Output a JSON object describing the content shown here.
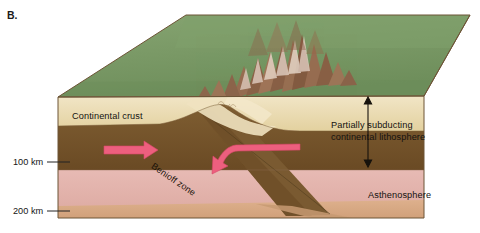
{
  "figure": {
    "panel_label": "B.",
    "type": "geologic block diagram"
  },
  "labels": {
    "continental_crust": "Continental crust",
    "benioff_zone": "Benioff zone",
    "partially_subducting": "Partially subducting\ncontinental lithosphere",
    "partially_subducting_line1": "Partially subducting",
    "partially_subducting_line2": "continental lithosphere",
    "asthenosphere": "Asthenosphere"
  },
  "depth_scale": {
    "ticks": [
      {
        "label": "100 km",
        "y": 162
      },
      {
        "label": "200 km",
        "y": 211
      }
    ]
  },
  "colors": {
    "surface_green": "#7d9c6a",
    "surface_green_dark": "#6f8f5d",
    "crust_cream": "#e8d8ac",
    "crust_cream_light": "#f0e4c4",
    "mantle_brown": "#7b5a30",
    "mantle_brown_dark": "#6b4c26",
    "asthenosphere_pink": "#e3b3ae",
    "asthenosphere_pink_dark": "#dba79f",
    "lower_tan": "#d8a882",
    "arrow_pink": "#ed5f7e",
    "mountain_brown": "#8a5a45",
    "outline": "#6d5436",
    "text": "#141210"
  },
  "elements": {
    "arrow_left_block": "right-pointing pink arrow in left mantle lithosphere",
    "arrow_right_block": "curved pink arrow pointing left toward collision zone",
    "thickness_arrow": "vertical double-headed arrow spanning lithosphere thickness",
    "mountains": "collisional mountain range on green surface"
  }
}
